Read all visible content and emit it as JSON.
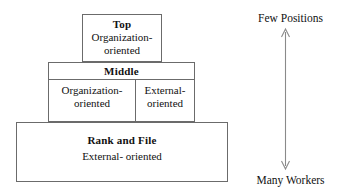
{
  "diagram": {
    "tiers": [
      {
        "id": "top",
        "title": "Top",
        "lines": [
          "Organization-",
          "oriented"
        ]
      },
      {
        "id": "middle",
        "title": "Middle",
        "columns": [
          {
            "id": "middle-left",
            "lines": [
              "Organization-",
              "oriented"
            ]
          },
          {
            "id": "middle-right",
            "lines": [
              "External-",
              "oriented"
            ]
          }
        ]
      },
      {
        "id": "rank-and-file",
        "title": "Rank and File",
        "lines": [
          "External- oriented"
        ]
      }
    ],
    "axis": {
      "top_label": "Few Positions",
      "bottom_label": "Many Workers",
      "arrow": "double-headed-vertical-arrow"
    },
    "colors": {
      "border": "#6b6b6b",
      "text": "#111111",
      "background": "#ffffff",
      "arrow": "#8a8a8a"
    }
  }
}
